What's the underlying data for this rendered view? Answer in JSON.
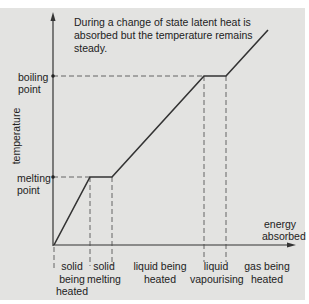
{
  "diagram": {
    "caption": "During a change of state latent heat is absorbed but the temperature remains steady.",
    "y_axis_label": "temperature",
    "x_axis_label_line1": "energy",
    "x_axis_label_line2": "absorbed",
    "y_markers": {
      "boiling_line1": "boiling",
      "boiling_line2": "point",
      "melting_line1": "melting",
      "melting_line2": "point"
    },
    "phases": [
      {
        "line1": "solid",
        "line2": "being",
        "line3": "heated"
      },
      {
        "line1": "solid",
        "line2": "melting"
      },
      {
        "line1": "liquid being",
        "line2": "heated"
      },
      {
        "line1": "liquid",
        "line2": "vapourising"
      },
      {
        "line1": "gas being",
        "line2": "heated"
      }
    ],
    "colors": {
      "background": "#e3e3e1",
      "line": "#333333"
    },
    "heating_curve_points": [
      {
        "energy": 0,
        "temperature": "low",
        "stage": "start"
      },
      {
        "energy": 1,
        "temperature": "melting point",
        "stage": "solid heated"
      },
      {
        "energy": 2,
        "temperature": "melting point",
        "stage": "melting"
      },
      {
        "energy": 3,
        "temperature": "boiling point",
        "stage": "liquid heated"
      },
      {
        "energy": 4,
        "temperature": "boiling point",
        "stage": "vapourising"
      },
      {
        "energy": 5,
        "temperature": "above boiling",
        "stage": "gas heated"
      }
    ]
  }
}
